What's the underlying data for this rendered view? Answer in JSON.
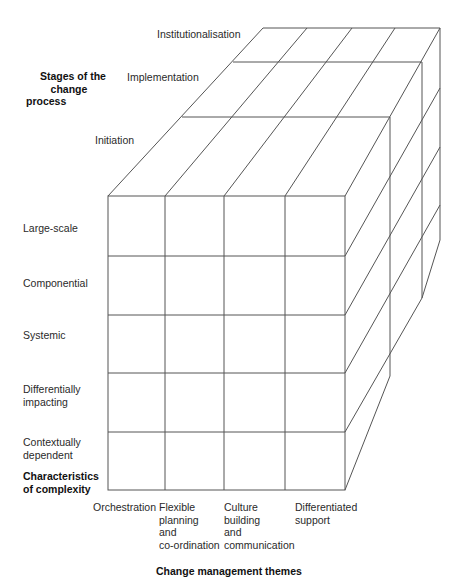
{
  "stages": {
    "title_lines": [
      "Stages of the",
      "change",
      "process"
    ],
    "items": [
      "Initiation",
      "Implementation",
      "Institutionalisation"
    ]
  },
  "complexity": {
    "title_lines": [
      "Characteristics",
      "of complexity"
    ],
    "items": [
      [
        "Large-scale"
      ],
      [
        "Componential"
      ],
      [
        "Systemic"
      ],
      [
        "Differentially",
        "impacting"
      ],
      [
        "Contextually",
        "dependent"
      ]
    ]
  },
  "themes": {
    "title": "Change management themes",
    "items": [
      [
        "Orchestration"
      ],
      [
        "Flexible",
        "planning",
        "and",
        "co-ordination"
      ],
      [
        "Culture",
        "building",
        "and",
        "communication"
      ],
      [
        "Differentiated",
        "support"
      ]
    ]
  },
  "colors": {
    "line": "#555555",
    "text": "#2a2a2a"
  }
}
